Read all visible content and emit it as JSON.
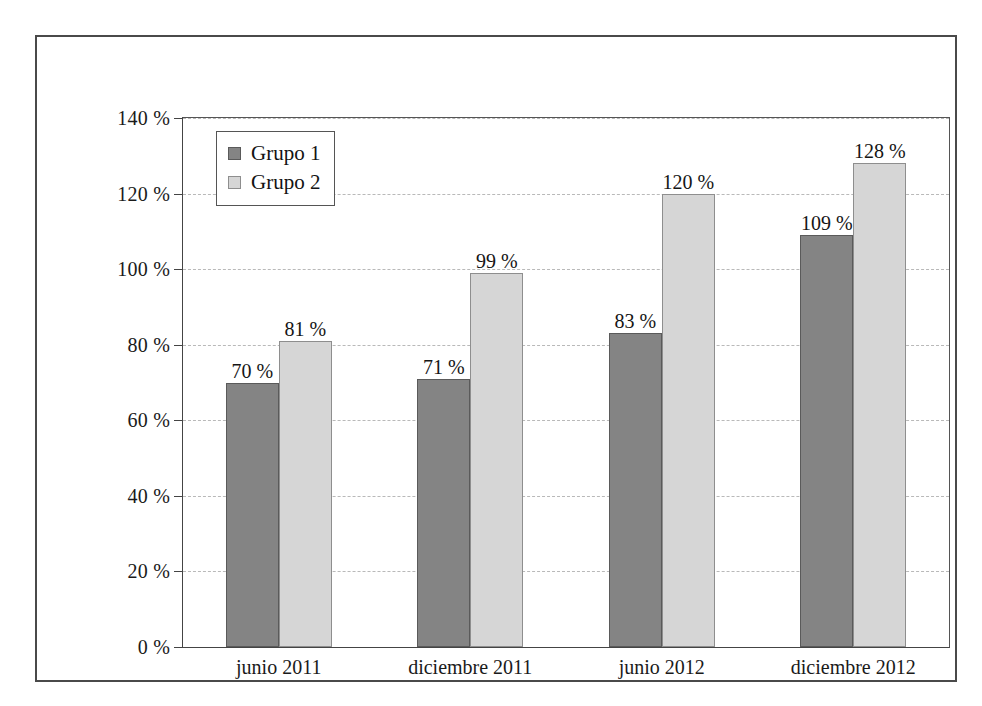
{
  "chart_data": {
    "type": "bar",
    "title": "",
    "subtitle": "",
    "xlabel": "",
    "ylabel": "",
    "categories": [
      "junio 2011",
      "diciembre 2011",
      "junio 2012",
      "diciembre 2012"
    ],
    "series": [
      {
        "name": "Grupo 1",
        "color": "#848484",
        "values": [
          70,
          71,
          83,
          109
        ],
        "labels": [
          "70 %",
          "71 %",
          "83 %",
          "109 %"
        ]
      },
      {
        "name": "Grupo 2",
        "color": "#d6d6d6",
        "values": [
          81,
          99,
          120,
          128
        ],
        "labels": [
          "81 %",
          "99 %",
          "120 %",
          "128 %"
        ]
      }
    ],
    "ylim": [
      0,
      140
    ],
    "ytick_values": [
      0,
      20,
      40,
      60,
      80,
      100,
      120,
      140
    ],
    "ytick_labels": [
      "0 %",
      "20 %",
      "40 %",
      "60 %",
      "80 %",
      "100 %",
      "120 %",
      "140 %"
    ],
    "grid": true,
    "grid_axis": "y",
    "grid_style": "dashed",
    "grid_color": "#b9b9b9",
    "legend_position": "top-left",
    "value_labels": true,
    "value_label_suffix": " %",
    "frame": true,
    "background": "#ffffff"
  },
  "legend": {
    "entries": [
      {
        "label": "Grupo 1",
        "swatch": "legend-swatch-grupo-1"
      },
      {
        "label": "Grupo 2",
        "swatch": "legend-swatch-grupo-2"
      }
    ]
  }
}
